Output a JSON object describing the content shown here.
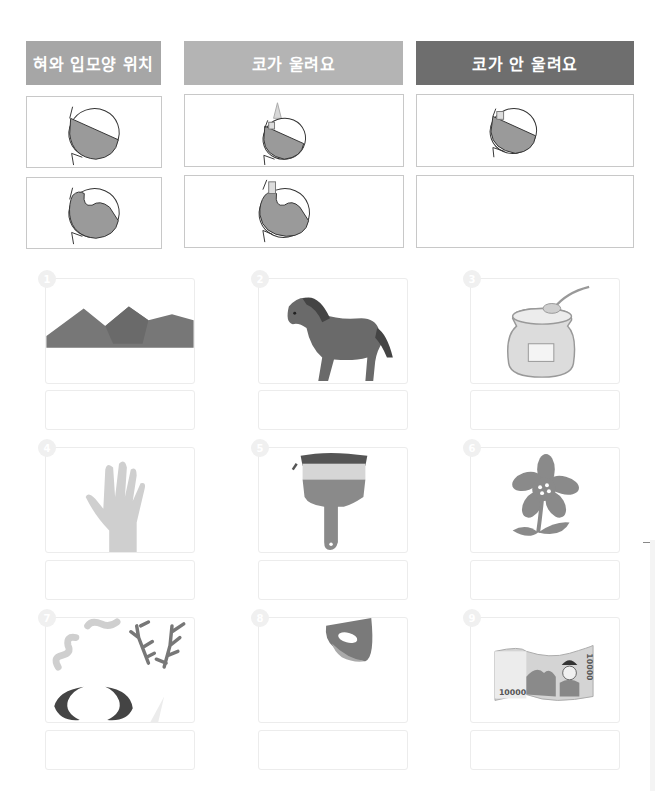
{
  "table": {
    "headers": [
      {
        "label": "혀와 입모양 위치",
        "color": "#a6a6a6"
      },
      {
        "label": "코가 울려요",
        "color": "#b4b4b4"
      },
      {
        "label": "코가 안 울려요",
        "color": "#6e6e6e"
      }
    ],
    "rows": [
      {
        "cells": [
          "tongue-tip-diagram",
          "nasal-tongue-tip-diagram",
          "oral-tongue-tip-diagram"
        ]
      },
      {
        "cells": [
          "tongue-back-diagram",
          "nasal-tongue-back-diagram",
          ""
        ]
      }
    ]
  },
  "cards": [
    {
      "number": "1",
      "image": "mountains",
      "answer": ""
    },
    {
      "number": "2",
      "image": "horse",
      "answer": ""
    },
    {
      "number": "3",
      "image": "honey-jar",
      "answer": ""
    },
    {
      "number": "4",
      "image": "hand",
      "answer": ""
    },
    {
      "number": "5",
      "image": "paintbrush",
      "answer": ""
    },
    {
      "number": "6",
      "image": "flower",
      "answer": ""
    },
    {
      "number": "7",
      "image": "horns-and-antlers",
      "answer": ""
    },
    {
      "number": "8",
      "image": "bell",
      "answer": ""
    },
    {
      "number": "9",
      "image": "banknote",
      "answer": ""
    }
  ],
  "banknote": {
    "value_left": "10000",
    "value_right": "10000"
  },
  "colors": {
    "dark": "#555555",
    "mid": "#8a8a8a",
    "light": "#cfcfcf"
  }
}
